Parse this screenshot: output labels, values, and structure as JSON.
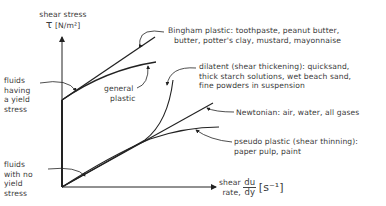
{
  "diagram": {
    "y_axis": {
      "label_line1": "shear stress",
      "symbol": "τ",
      "unit": "[N/m²]"
    },
    "x_axis": {
      "label_line1": "shear",
      "label_line2": "rate,",
      "frac_num": "du",
      "frac_den": "dy",
      "unit": "[s⁻¹]"
    },
    "groups": {
      "yield": [
        "fluids",
        "having",
        "a yield",
        "stress"
      ],
      "no_yield": [
        "fluids",
        "with no",
        "yield",
        "stress"
      ]
    },
    "curves": {
      "bingham": {
        "line1": "Bingham plastic: toothpaste, peanut butter,",
        "line2": "butter, potter's clay, mustard, mayonnaise"
      },
      "general_plastic": {
        "line1": "general",
        "line2": "plastic"
      },
      "dilatant": {
        "line1": "dilatent (shear thickening): quicksand,",
        "line2": "thick starch solutions, wet beach sand,",
        "line3": "fine powders in suspension"
      },
      "newtonian": {
        "line1": "Newtonian: air, water, all gases"
      },
      "pseudo_plastic": {
        "line1": "pseudo plastic (shear thinning):",
        "line2": "paper pulp, paint"
      }
    },
    "colors": {
      "line": "#222222",
      "text": "#3a3a3a"
    }
  }
}
